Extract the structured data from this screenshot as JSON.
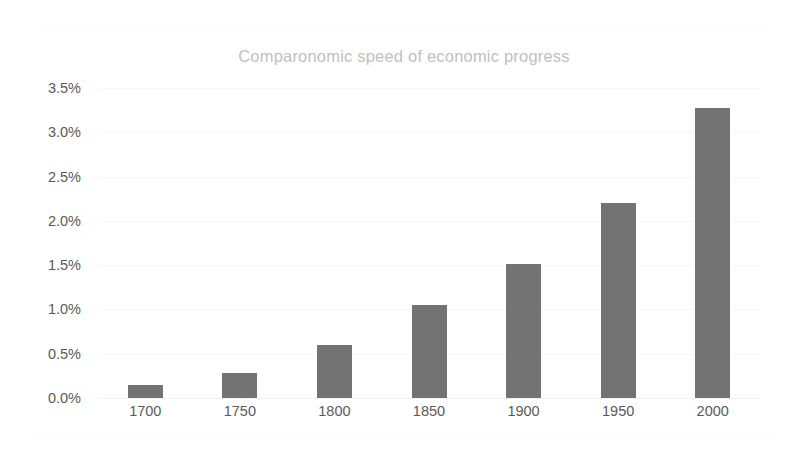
{
  "chart_data": {
    "type": "bar",
    "title": "Comparonomic speed of economic progress",
    "xlabel": "",
    "ylabel": "",
    "categories": [
      "1700",
      "1750",
      "1800",
      "1850",
      "1900",
      "1950",
      "2000"
    ],
    "values": [
      0.15,
      0.28,
      0.6,
      1.05,
      1.51,
      2.2,
      3.28
    ],
    "value_unit": "%",
    "ylim": [
      0.0,
      3.5
    ],
    "ytick_values": [
      0.0,
      0.5,
      1.0,
      1.5,
      2.0,
      2.5,
      3.0,
      3.5
    ],
    "ytick_labels": [
      "0.0%",
      "0.5%",
      "1.0%",
      "1.5%",
      "2.0%",
      "2.5%",
      "3.0%",
      "3.5%"
    ],
    "grid": true,
    "legend": false,
    "legend_position": "none",
    "series": [
      {
        "name": "Speed of economic progress",
        "values": [
          0.15,
          0.28,
          0.6,
          1.05,
          1.51,
          2.2,
          3.28
        ]
      }
    ],
    "colors": {
      "bar": "#737373",
      "title_text": "#bfbfbf",
      "tick_text": "#5a5a5a",
      "gridline": "#f7f7f7",
      "plot_background": "#ffffff",
      "frame_border": "#fbfbfb"
    }
  }
}
